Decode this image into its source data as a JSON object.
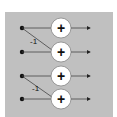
{
  "diagram": {
    "type": "signal-flow",
    "background": "#ffffff",
    "panel_color": "#c0c0c0",
    "rows": [
      {
        "y": 28,
        "node": "input-1",
        "op": "+"
      },
      {
        "y": 52,
        "node": "input-2",
        "op": "+"
      },
      {
        "y": 76,
        "node": "input-3",
        "op": "+"
      },
      {
        "y": 99,
        "node": "input-4",
        "op": "+"
      }
    ],
    "cross_links": [
      {
        "from_row": 0,
        "to_row": 1,
        "weight": "-1"
      },
      {
        "from_row": 2,
        "to_row": 3,
        "weight": "-1"
      }
    ],
    "labels": {
      "weight_1": "-1",
      "weight_2": "-1",
      "plus_1": "+",
      "plus_2": "+",
      "plus_3": "+",
      "plus_4": "+"
    }
  }
}
